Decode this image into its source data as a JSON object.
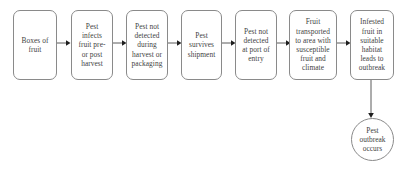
{
  "diagram": {
    "stroke_color": "#8a8a8a",
    "text_color": "#3f3f3f",
    "background_color": "#ffffff",
    "nodes": [
      {
        "id": "boxes-of-fruit",
        "label": "Boxes of\nfruit",
        "shape": "rounded-rect"
      },
      {
        "id": "pest-infects-fruit",
        "label": "Pest\ninfects\nfruit pre-\nor post\nharvest",
        "shape": "rounded-rect"
      },
      {
        "id": "pest-not-detected-harvest",
        "label": "Pest not\ndetected\nduring\nharvest or\npackaging",
        "shape": "rounded-rect"
      },
      {
        "id": "pest-survives-shipment",
        "label": "Pest\nsurvives\nshipment",
        "shape": "rounded-rect"
      },
      {
        "id": "pest-not-detected-port",
        "label": "Pest not\ndetected\nat port of\nentry",
        "shape": "rounded-rect"
      },
      {
        "id": "fruit-transported",
        "label": "Fruit\ntransported\nto area with\nsusceptible\nfruit and\nclimate",
        "shape": "rounded-rect"
      },
      {
        "id": "infested-fruit-habitat",
        "label": "Infested\nfruit in\nsuitable\nhabitat\nleads to\noutbreak",
        "shape": "rounded-rect"
      },
      {
        "id": "pest-outbreak-occurs",
        "label": "Pest\noutbreak\noccurs",
        "shape": "ellipse"
      }
    ],
    "connectors": [
      {
        "id": "arrow-1",
        "from": "boxes-of-fruit",
        "to": "pest-infects-fruit",
        "direction": "right"
      },
      {
        "id": "arrow-2",
        "from": "pest-infects-fruit",
        "to": "pest-not-detected-harvest",
        "direction": "right"
      },
      {
        "id": "arrow-3",
        "from": "pest-not-detected-harvest",
        "to": "pest-survives-shipment",
        "direction": "right"
      },
      {
        "id": "arrow-4",
        "from": "pest-survives-shipment",
        "to": "pest-not-detected-port",
        "direction": "right"
      },
      {
        "id": "arrow-5",
        "from": "pest-not-detected-port",
        "to": "fruit-transported",
        "direction": "right"
      },
      {
        "id": "arrow-6",
        "from": "fruit-transported",
        "to": "infested-fruit-habitat",
        "direction": "right"
      },
      {
        "id": "arrow-7",
        "from": "infested-fruit-habitat",
        "to": "pest-outbreak-occurs",
        "direction": "down"
      }
    ]
  }
}
